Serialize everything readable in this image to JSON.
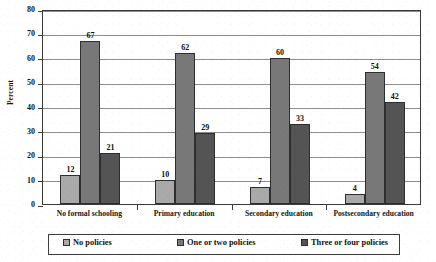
{
  "chart_data": {
    "type": "bar",
    "title": "",
    "xlabel": "",
    "ylabel": "Percent",
    "ylim": [
      0,
      80
    ],
    "ytick_step": 10,
    "yticks": [
      "80",
      "70",
      "60",
      "50",
      "40",
      "30",
      "20",
      "10",
      "0"
    ],
    "grid": true,
    "legend_position": "bottom",
    "categories": [
      "No formal schooling",
      "Primary education",
      "Secondary education",
      "Postsecondary education"
    ],
    "series": [
      {
        "name": "No policies",
        "color": "#a9a9a9",
        "values": [
          12,
          10,
          7,
          4
        ]
      },
      {
        "name": "One or two policies",
        "color": "#787878",
        "values": [
          67,
          62,
          60,
          54
        ]
      },
      {
        "name": "Three or four policies",
        "color": "#545454",
        "values": [
          21,
          29,
          33,
          42
        ]
      }
    ]
  }
}
